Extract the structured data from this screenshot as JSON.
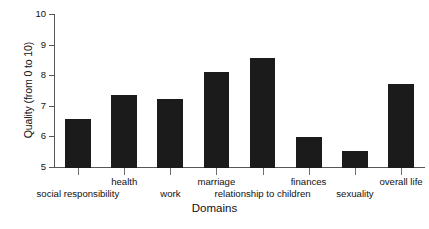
{
  "chart_data": {
    "type": "bar",
    "title": "",
    "xlabel": "Domains",
    "ylabel": "Quality (from 0 to 10)",
    "ylim": [
      5,
      10
    ],
    "yticks": [
      5,
      6,
      7,
      8,
      9,
      10
    ],
    "ytick_labels": [
      "5",
      "6",
      "7",
      "8",
      "9",
      "10"
    ],
    "grid": false,
    "legend": null,
    "bar_color": "#1b1b1b",
    "axis_color": "#565656",
    "categories": [
      "social responsibility",
      "health",
      "work",
      "marriage",
      "relationship to children",
      "finances",
      "sexuality",
      "overall life"
    ],
    "values": [
      6.6,
      7.4,
      7.25,
      8.15,
      8.6,
      6.0,
      5.55,
      7.75
    ],
    "label_rows": [
      1,
      0,
      1,
      0,
      1,
      0,
      1,
      0
    ]
  }
}
